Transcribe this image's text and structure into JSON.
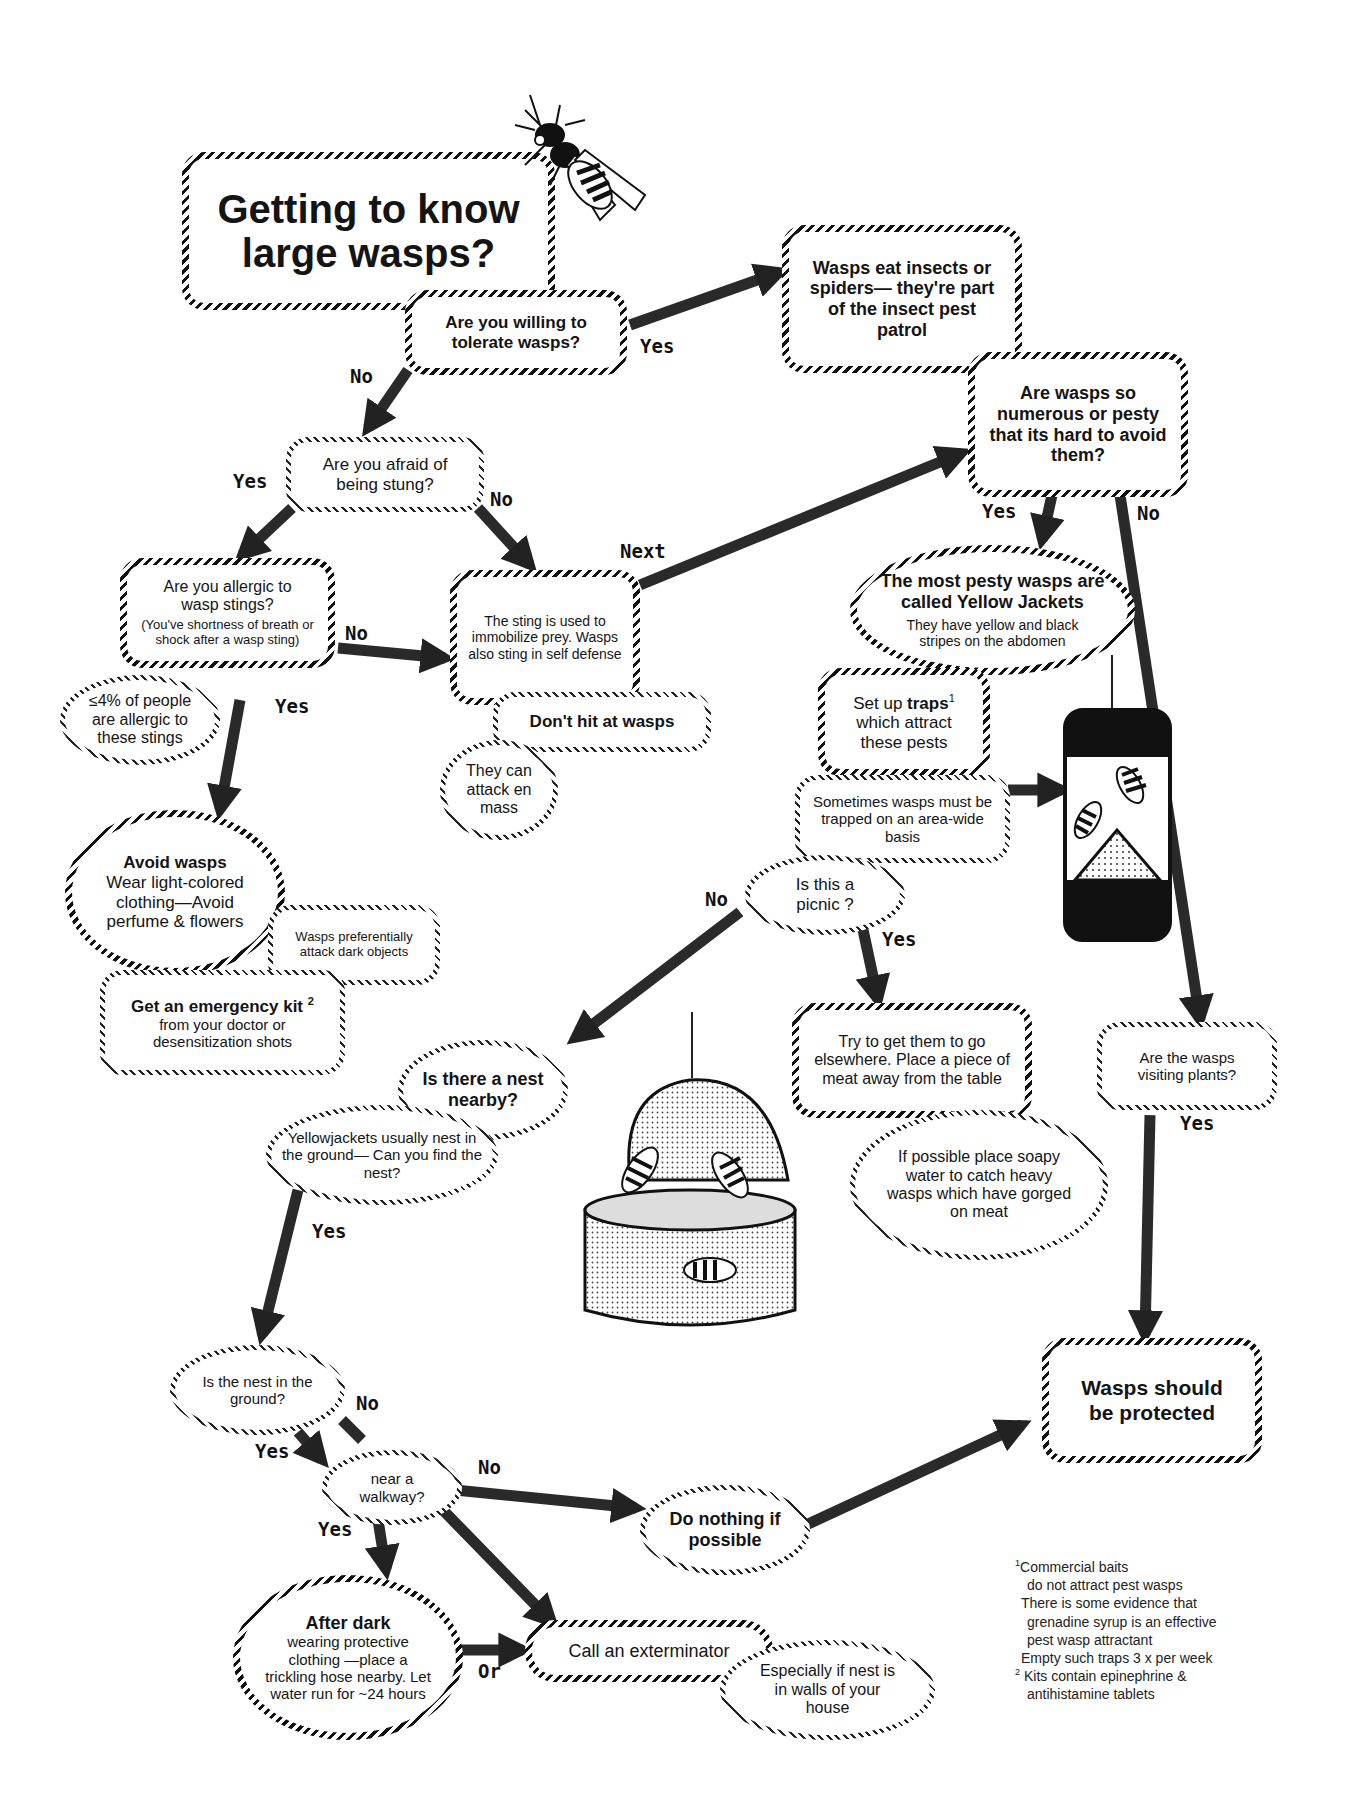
{
  "title": "Getting to know large wasps?",
  "nodes": {
    "tolerate": "Are you willing to tolerate wasps?",
    "eat_insects": "Wasps eat insects or spiders— they're part of the insect pest patrol",
    "numerous": "Are wasps so numerous or pesty that its hard to avoid them?",
    "afraid": "Are you afraid of being stung?",
    "allergic_q": "Are you allergic to wasp stings?",
    "allergic_note": "(You've shortness of breath or shock after a wasp sting)",
    "allergic_pct": "≤4% of people are allergic to these stings",
    "sting_use": "The sting is used to immobilize prey. Wasps also sting in self defense",
    "dont_hit": "Don't hit at wasps",
    "attack_mass": "They can attack en mass",
    "avoid_title": "Avoid wasps",
    "avoid_body": "Wear light-colored clothing—Avoid perfume & flowers",
    "dark_objects": "Wasps preferentially attack dark objects",
    "kit_title": "Get an emergency kit",
    "kit_sup": "2",
    "kit_body": "from your doctor or desensitization shots",
    "yj_title": "The most pesty wasps are called Yellow Jackets",
    "yj_body": "They have yellow and black stripes on the abdomen",
    "traps_pre": "Set up",
    "traps_bold": "traps",
    "traps_sup": "1",
    "traps_post": "which attract these pests",
    "area_wide": "Sometimes wasps must be trapped on an area-wide basis",
    "picnic": "Is this a picnic ?",
    "elsewhere": "Try to get them to go elsewhere. Place a piece of meat away from the table",
    "soapy": "If possible place soapy water to catch heavy wasps which have gorged on meat",
    "nest_nearby": "Is there a nest nearby?",
    "find_nest": "Yellowjackets usually nest in the ground— Can you find the nest?",
    "visiting_plants": "Are the wasps visiting plants?",
    "protected": "Wasps should be protected",
    "in_ground": "Is the nest in the ground?",
    "walkway": "near a walkway?",
    "do_nothing": "Do nothing if possible",
    "after_dark_title": "After dark",
    "after_dark_body": "wearing protective clothing —place a trickling hose nearby. Let water run for ~24 hours",
    "exterminator": "Call an exterminator",
    "walls": "Especially if nest is in walls of your house"
  },
  "edge_labels": {
    "yes_tolerate": "Yes",
    "no_tolerate": "No",
    "yes_afraid": "Yes",
    "no_afraid": "No",
    "next": "Next",
    "no_allergic": "No",
    "yes_allergic": "Yes",
    "yes_numerous": "Yes",
    "no_numerous": "No",
    "no_picnic": "No",
    "yes_picnic": "Yes",
    "yes_plants": "Yes",
    "yes_find": "Yes",
    "no_ground": "No",
    "yes_ground": "Yes",
    "no_walkway": "No",
    "yes_walkway": "Yes",
    "or": "Or"
  },
  "footnotes": {
    "n1_mark": "1",
    "n1_l1": "Commercial baits",
    "n1_l2": "do not attract pest wasps",
    "n1_l3": "There is some evidence that",
    "n1_l4": "grenadine syrup is an effective",
    "n1_l5": "pest wasp attractant",
    "n1_l6": "Empty such traps 3 x per week",
    "n2_mark": "2",
    "n2_l1": "Kits contain epinephrine &",
    "n2_l2": "antihistamine tablets"
  },
  "illustrations": [
    "wasp-icon",
    "wasp-trap",
    "meat-bowl-with-wasps"
  ]
}
